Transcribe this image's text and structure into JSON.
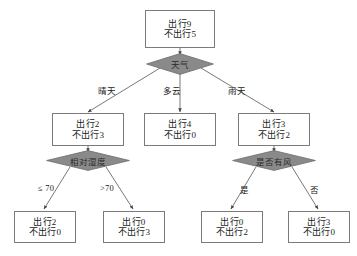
{
  "diagram": {
    "type": "decision-tree",
    "title": "",
    "background_color": "#ffffff",
    "box_border_color": "#7b7b7b",
    "diamond_fill_color": "#8a8a8a",
    "diamond_border_color": "#6e6e6e",
    "edge_color": "#555555",
    "nodes": {
      "root": {
        "line1": "出行9",
        "line2": "不出行5"
      },
      "sunny_box": {
        "line1": "出行2",
        "line2": "不出行3"
      },
      "cloudy_leaf": {
        "line1": "出行4",
        "line2": "不出行0"
      },
      "rainy_box": {
        "line1": "出行3",
        "line2": "不出行2"
      },
      "humidity_low_leaf": {
        "line1": "出行2",
        "line2": "不出行0"
      },
      "humidity_high_leaf": {
        "line1": "出行0",
        "line2": "不出行3"
      },
      "windy_yes_leaf": {
        "line1": "出行0",
        "line2": "不出行2"
      },
      "windy_no_leaf": {
        "line1": "出行3",
        "line2": "不出行0"
      }
    },
    "decisions": {
      "weather": "天气",
      "humidity": "相对湿度",
      "windy": "是否有风"
    },
    "edge_labels": {
      "sunny": "晴天",
      "cloudy": "多云",
      "rainy": "雨天",
      "humidity_low": "≤ 70",
      "humidity_high": ">70",
      "windy_yes": "是",
      "windy_no": "否"
    }
  }
}
